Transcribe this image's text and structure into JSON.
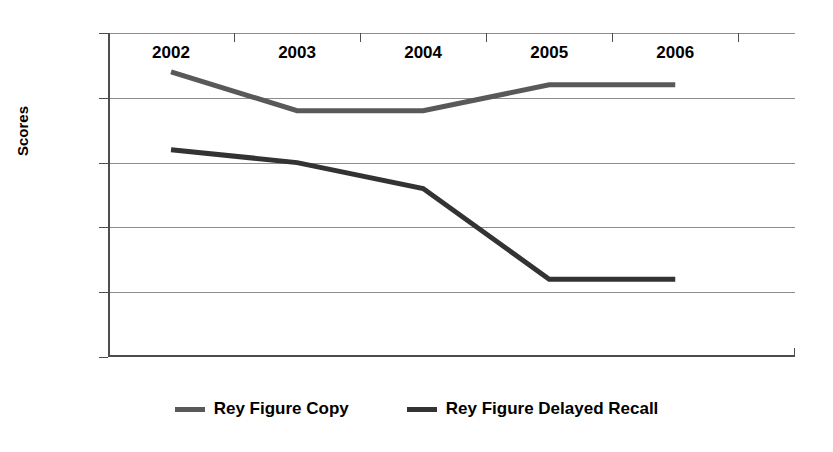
{
  "chart_data": {
    "type": "line",
    "title": "",
    "xlabel": "",
    "ylabel": "Scores",
    "categories": [
      "2002",
      "2003",
      "2004",
      "2005",
      "2006"
    ],
    "ylim": [
      0,
      25
    ],
    "ytick_step": 5,
    "yticks": [
      "0",
      "5",
      "10",
      "15",
      "20",
      "25"
    ],
    "grid": true,
    "legend_position": "bottom",
    "series": [
      {
        "name": "Rey Figure Copy",
        "color": "#595959",
        "values": [
          22,
          19,
          19,
          21,
          21
        ]
      },
      {
        "name": "Rey Figure Delayed Recall",
        "color": "#333333",
        "values": [
          16,
          15,
          13,
          6,
          6
        ]
      }
    ]
  },
  "axis": {
    "y_title": "Scores"
  },
  "legend": {
    "items": [
      {
        "label": "Rey Figure Copy",
        "color": "#595959"
      },
      {
        "label": "Rey Figure Delayed Recall",
        "color": "#333333"
      }
    ]
  }
}
